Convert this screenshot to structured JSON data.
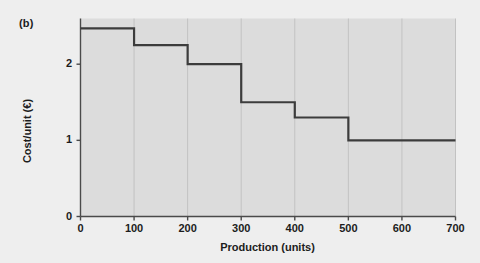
{
  "panel": {
    "label": "(b)"
  },
  "colors": {
    "page_background": "#eeeeee",
    "plot_background": "#dcdcdc",
    "grid": "#c2c2c2",
    "axis": "#4a4a4a",
    "line": "#3c3c3c",
    "text": "#1c1c1c"
  },
  "chart_data": {
    "type": "line",
    "title": "",
    "subtitle": "",
    "xlabel": "Production (units)",
    "ylabel": "Cost/unit (€)",
    "xlim": [
      0,
      700
    ],
    "ylim": [
      0,
      2.6
    ],
    "xticks": [
      0,
      100,
      200,
      300,
      400,
      500,
      600,
      700
    ],
    "xtick_labels": [
      "0",
      "100",
      "200",
      "300",
      "400",
      "500",
      "600",
      "700"
    ],
    "yticks": [
      0,
      1,
      2
    ],
    "ytick_labels": [
      "0",
      "1",
      "2"
    ],
    "grid": true,
    "grid_axis": "x",
    "legend": null,
    "drawstyle": "steps-post",
    "series": [
      {
        "name": "Cost per unit",
        "steps": [
          {
            "x_start": 0,
            "x_end": 100,
            "value": 2.47
          },
          {
            "x_start": 100,
            "x_end": 200,
            "value": 2.25
          },
          {
            "x_start": 200,
            "x_end": 300,
            "value": 2.0
          },
          {
            "x_start": 300,
            "x_end": 400,
            "value": 1.5
          },
          {
            "x_start": 400,
            "x_end": 500,
            "value": 1.3
          },
          {
            "x_start": 500,
            "x_end": 700,
            "value": 1.0
          }
        ],
        "x": [
          0,
          100,
          100,
          200,
          200,
          300,
          300,
          400,
          400,
          500,
          500,
          700
        ],
        "y": [
          2.47,
          2.47,
          2.25,
          2.25,
          2.0,
          2.0,
          1.5,
          1.5,
          1.3,
          1.3,
          1.0,
          1.0
        ]
      }
    ]
  }
}
